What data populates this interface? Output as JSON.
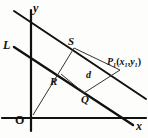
{
  "figure": {
    "kind": "geometry-diagram",
    "background_color": "#fdfdfb",
    "ink_color": "#111111",
    "axes": {
      "x_label": "x",
      "y_label": "y",
      "origin_label": "O"
    },
    "labels": {
      "line_L": "L",
      "point_S": "S",
      "point_R": "R",
      "point_Q": "Q",
      "distance": "d",
      "point_P_name": "P",
      "point_P_sub": "1",
      "point_P_open": "(",
      "point_P_x": "x",
      "point_P_x_sub": "1",
      "point_P_comma": ",",
      "point_P_y": "y",
      "point_P_y_sub": "1",
      "point_P_close": ")"
    },
    "geometry": {
      "x_axis": {
        "x1": 2,
        "y1": 118,
        "x2": 146,
        "y2": 118,
        "stroke": "#111111",
        "width": 2.2
      },
      "y_axis": {
        "x1": 31,
        "y1": 10,
        "x2": 31,
        "y2": 131,
        "stroke": "#111111",
        "width": 2.2
      },
      "line_upper": {
        "x1": 14,
        "y1": 11,
        "x2": 146,
        "y2": 99,
        "stroke": "#111111",
        "width": 2.0
      },
      "line_L": {
        "x1": 14,
        "y1": 47,
        "x2": 133,
        "y2": 125,
        "stroke": "#111111",
        "width": 2.4
      },
      "thin_O_to_S": {
        "x1": 33,
        "y1": 115,
        "x2": 74,
        "y2": 48,
        "stroke": "#333333",
        "width": 1.0
      },
      "thin_Q_to_P": {
        "x1": 84,
        "y1": 93,
        "x2": 120,
        "y2": 70,
        "stroke": "#333333",
        "width": 1.0
      },
      "thin_S_to_P": {
        "x1": 74,
        "y1": 48,
        "x2": 120,
        "y2": 70,
        "stroke": "#333333",
        "width": 1.0
      },
      "thin_R_to_Q": {
        "x1": 61,
        "y1": 74,
        "x2": 84,
        "y2": 93,
        "stroke": "#333333",
        "width": 1.0
      }
    }
  }
}
